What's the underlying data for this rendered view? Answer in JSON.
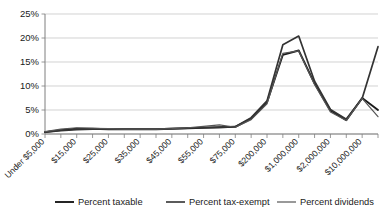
{
  "chart_data": {
    "type": "line",
    "title": "",
    "subtitle": "",
    "xlabel": "",
    "ylabel": "",
    "ylim": [
      0,
      25
    ],
    "yticks": [
      0,
      5,
      10,
      15,
      20,
      25
    ],
    "ytick_labels": [
      "0%",
      "5%",
      "10%",
      "15%",
      "20%",
      "25%"
    ],
    "grid": true,
    "legend_position": "bottom",
    "categories": [
      "Under $5,000",
      "$10,000",
      "$15,000",
      "$20,000",
      "$25,000",
      "$30,000",
      "$35,000",
      "$40,000",
      "$45,000",
      "$50,000",
      "$55,000",
      "$60,000",
      "$75,000",
      "$100,000",
      "$200,000",
      "$500,000",
      "$1,000,000",
      "$1,500,000",
      "$2,000,000",
      "$5,000,000",
      "$10,000,000",
      "$10,000,000 and over"
    ],
    "xtick_labels": [
      "Under $5,000",
      "$15,000",
      "$25,000",
      "$35,000",
      "$45,000",
      "$55,000",
      "$75,000",
      "$200,000",
      "$1,000,000",
      "$2,000,000",
      "$10,000,000"
    ],
    "series": [
      {
        "name": "Percent taxable",
        "color": "#1a1a1a",
        "width": 1.9,
        "values": [
          0.4,
          0.8,
          1.1,
          1.1,
          1.0,
          1.0,
          1.0,
          1.0,
          1.1,
          1.2,
          1.3,
          1.4,
          1.5,
          3.2,
          6.6,
          16.5,
          17.4,
          10.5,
          4.9,
          2.9,
          7.5,
          5.0
        ]
      },
      {
        "name": "Percent tax-exempt",
        "color": "#333333",
        "width": 1.7,
        "values": [
          0.4,
          0.7,
          0.9,
          1.0,
          1.0,
          1.0,
          1.0,
          1.0,
          1.1,
          1.2,
          1.3,
          1.4,
          1.5,
          3.4,
          6.9,
          18.6,
          20.4,
          11.0,
          5.1,
          3.1,
          7.4,
          18.2
        ]
      },
      {
        "name": "Percent dividends",
        "color": "#555555",
        "width": 1.2,
        "values": [
          0.5,
          1.0,
          1.3,
          1.2,
          1.1,
          1.0,
          1.0,
          1.0,
          1.1,
          1.3,
          1.6,
          1.9,
          1.4,
          3.0,
          6.3,
          16.8,
          17.3,
          10.3,
          4.6,
          2.8,
          7.4,
          3.6
        ]
      }
    ],
    "legend_entries": [
      {
        "label": "Percent taxable",
        "color": "#1a1a1a"
      },
      {
        "label": "Percent tax-exempt",
        "color": "#333333"
      },
      {
        "label": "Percent dividends",
        "color": "#555555"
      }
    ]
  },
  "colors": {
    "gridline": "#bfbfbf",
    "axis": "#7f7f7f",
    "text": "#1a1a1a",
    "background": "#ffffff"
  }
}
